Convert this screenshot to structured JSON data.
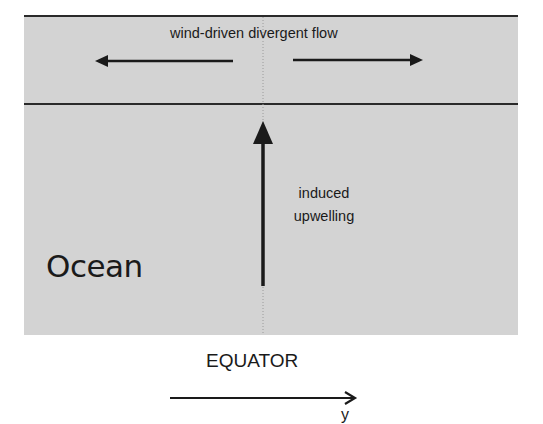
{
  "diagram": {
    "region_label": "Ocean",
    "surface_flow_label": "wind-driven divergent flow",
    "upwelling_label_line1": "induced",
    "upwelling_label_line2": "upwelling",
    "equator_label": "EQUATOR",
    "axis_label": "y",
    "colors": {
      "ocean_fill": "#d3d3d3",
      "lines": "#1a1a1a",
      "background": "#ffffff"
    }
  }
}
